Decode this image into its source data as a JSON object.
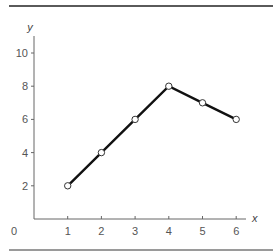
{
  "chart_data": {
    "type": "line",
    "title": "",
    "xlabel": "x",
    "ylabel": "y",
    "x": [
      1,
      2,
      3,
      4,
      5,
      6
    ],
    "series": [
      {
        "name": "y",
        "values": [
          2,
          4,
          6,
          8,
          7,
          6
        ]
      }
    ],
    "x_ticks": [
      "1",
      "2",
      "3",
      "4",
      "5",
      "6"
    ],
    "y_ticks": [
      "2",
      "4",
      "6",
      "8",
      "10"
    ],
    "origin_label": "0",
    "xlim": [
      0,
      6.5
    ],
    "ylim": [
      0,
      11
    ],
    "grid": false,
    "legend": "none",
    "marker": "open-circle",
    "line_color": "#111111"
  }
}
